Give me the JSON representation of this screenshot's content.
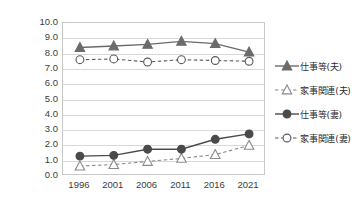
{
  "chart_data": {
    "type": "line",
    "title": "",
    "xlabel": "",
    "ylabel": "",
    "categories": [
      "1996",
      "2001",
      "2006",
      "2011",
      "2016",
      "2021"
    ],
    "ylim": [
      0.0,
      10.0
    ],
    "ytick_step": 1.0,
    "grid": true,
    "legend_position": "right",
    "yticks": [
      "10.0",
      "9.0",
      "8.0",
      "7.0",
      "6.0",
      "5.0",
      "4.0",
      "3.0",
      "2.0",
      "1.0",
      "0.0"
    ],
    "series": [
      {
        "name": "仕事等(夫)",
        "marker": "filled-triangle",
        "line": "solid",
        "color": "#6b6b6b",
        "values": [
          8.4,
          8.5,
          8.6,
          8.8,
          8.65,
          8.1
        ]
      },
      {
        "name": "家事関連(夫)",
        "marker": "hollow-triangle",
        "line": "dashed",
        "color": "#8a8a8a",
        "values": [
          0.65,
          0.75,
          0.95,
          1.15,
          1.4,
          2.0
        ]
      },
      {
        "name": "仕事等(妻)",
        "marker": "filled-circle",
        "line": "solid",
        "color": "#4a4a4a",
        "values": [
          1.3,
          1.35,
          1.75,
          1.75,
          2.4,
          2.75
        ]
      },
      {
        "name": "家事関連(妻)",
        "marker": "hollow-circle",
        "line": "dashed",
        "color": "#5a5a5a",
        "values": [
          7.6,
          7.65,
          7.45,
          7.6,
          7.55,
          7.5
        ]
      }
    ]
  },
  "legend": {
    "items": [
      {
        "label": "仕事等(夫)"
      },
      {
        "label": "家事関連(夫)"
      },
      {
        "label": "仕事等(妻)"
      },
      {
        "label": "家事関連(妻)"
      }
    ]
  },
  "colors": {
    "grid": "#d8d8d8",
    "border": "#c9c9c9",
    "text": "#3c3c3c"
  }
}
